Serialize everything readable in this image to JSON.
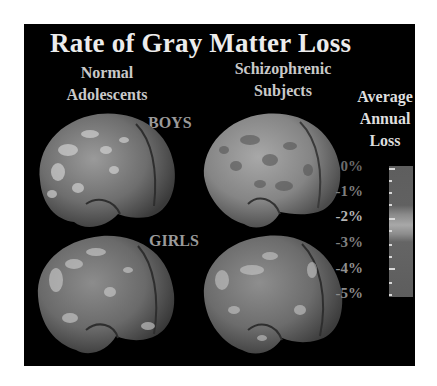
{
  "figure": {
    "title": "Rate of Gray Matter Loss",
    "columns": [
      {
        "label_line1": "Normal",
        "label_line2": "Adolescents"
      },
      {
        "label_line1": "Schizophrenic",
        "label_line2": "Subjects"
      }
    ],
    "rows": [
      {
        "label": "BOYS"
      },
      {
        "label": "GIRLS"
      }
    ],
    "panels": [
      {
        "row": "BOYS",
        "column": "Normal Adolescents",
        "content": "brain-lateral-view"
      },
      {
        "row": "BOYS",
        "column": "Schizophrenic Subjects",
        "content": "brain-lateral-view"
      },
      {
        "row": "GIRLS",
        "column": "Normal Adolescents",
        "content": "brain-lateral-view"
      },
      {
        "row": "GIRLS",
        "column": "Schizophrenic Subjects",
        "content": "brain-lateral-view"
      }
    ],
    "legend": {
      "title_line1": "Average",
      "title_line2": "Annual",
      "title_line3": "Loss",
      "labels": [
        "0%",
        "-1%",
        "-2%",
        "-3%",
        "-4%",
        "-5%"
      ]
    },
    "colors": {
      "background": "#000000",
      "title": "#ececec",
      "column_labels": "#c9c9c9",
      "row_labels": "#9a9a9a",
      "legend_bar": "#5e5e5e",
      "legend_highlight": "#a8a8a8"
    }
  }
}
